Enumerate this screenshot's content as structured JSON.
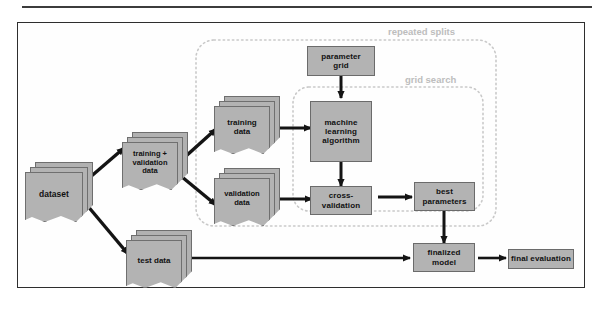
{
  "figure": {
    "type": "flowchart"
  },
  "regions": [
    {
      "id": "repeated-splits",
      "label": "repeated splits"
    },
    {
      "id": "grid-search",
      "label": "grid search"
    }
  ],
  "nodes": {
    "dataset": {
      "label": "dataset",
      "shape": "document-stack"
    },
    "training_validation": {
      "label": "training +\nvalidation\ndata",
      "line1": "training +",
      "line2": "validation",
      "line3": "data",
      "shape": "document-stack"
    },
    "training": {
      "label": "training data",
      "line1": "training",
      "line2": "data",
      "shape": "document-stack"
    },
    "validation": {
      "label": "validation data",
      "line1": "validation",
      "line2": "data",
      "shape": "document-stack"
    },
    "parameter_grid": {
      "label": "parameter grid",
      "line1": "parameter",
      "line2": "grid",
      "shape": "rectangle"
    },
    "ml_algorithm": {
      "label": "machine learning algorithm",
      "line1": "machine",
      "line2": "learning",
      "line3": "algorithm",
      "shape": "rectangle"
    },
    "cross_validation": {
      "label": "cross-validation",
      "line1": "cross-",
      "line2": "validation",
      "shape": "rectangle-stack"
    },
    "best_parameters": {
      "label": "best parameters",
      "line1": "best",
      "line2": "parameters",
      "shape": "rectangle"
    },
    "test_data": {
      "label": "test data",
      "shape": "document-stack"
    },
    "finalized_model": {
      "label": "finalized model",
      "line1": "finalized",
      "line2": "model",
      "shape": "rectangle"
    },
    "final_evaluation": {
      "label": "final evaluation",
      "shape": "rectangle-stack"
    }
  },
  "edges": [
    {
      "from": "dataset",
      "to": "training_validation"
    },
    {
      "from": "dataset",
      "to": "test_data"
    },
    {
      "from": "training_validation",
      "to": "training"
    },
    {
      "from": "training_validation",
      "to": "validation"
    },
    {
      "from": "training",
      "to": "ml_algorithm"
    },
    {
      "from": "parameter_grid",
      "to": "ml_algorithm"
    },
    {
      "from": "ml_algorithm",
      "to": "cross_validation"
    },
    {
      "from": "validation",
      "to": "cross_validation"
    },
    {
      "from": "cross_validation",
      "to": "best_parameters"
    },
    {
      "from": "best_parameters",
      "to": "finalized_model"
    },
    {
      "from": "test_data",
      "to": "finalized_model"
    },
    {
      "from": "finalized_model",
      "to": "final_evaluation"
    }
  ],
  "colors": {
    "node_fill": "#b3b3b3",
    "node_stroke": "#6b6b6b",
    "edge": "#141414",
    "frame": "#2e2e2e",
    "region_dotted": "#c9c9c9",
    "region_label": "#bdbdbd",
    "text": "#111111",
    "background": "#ffffff"
  }
}
